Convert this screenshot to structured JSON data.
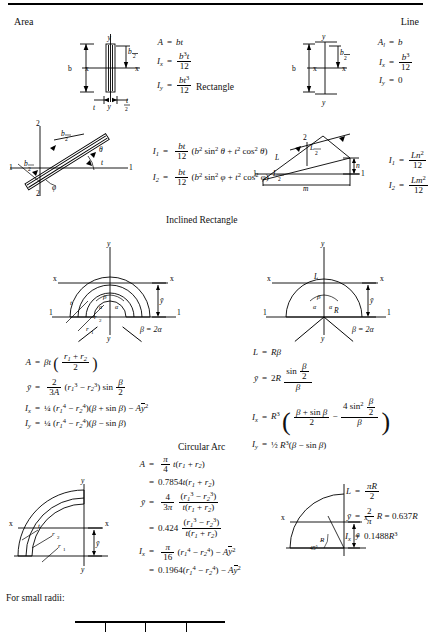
{
  "page": {
    "column_headers": {
      "left": "Area",
      "right": "Line"
    },
    "footer_note": "For small radii:"
  },
  "sections": [
    {
      "id": "rectangle",
      "caption": "Rectangle",
      "area": {
        "diagram_labels": [
          "y",
          "x",
          "x",
          "y",
          "b",
          "t",
          "b/2",
          "t/2"
        ],
        "equations": [
          {
            "lhs": "A",
            "rhs": "bt"
          },
          {
            "lhs": "Ix",
            "rhs": "b³t / 12"
          },
          {
            "lhs": "Iy",
            "rhs": "bt³ / 12"
          }
        ]
      },
      "line": {
        "diagram_labels": [
          "y",
          "x",
          "x",
          "y",
          "b",
          "b/2"
        ],
        "equations": [
          {
            "lhs": "Al",
            "rhs": "b"
          },
          {
            "lhs": "Ix",
            "rhs": "b³ / 12"
          },
          {
            "lhs": "Iy",
            "rhs": "0"
          }
        ]
      }
    },
    {
      "id": "inclined-rectangle",
      "caption": "Inclined Rectangle",
      "area": {
        "diagram_labels": [
          "1",
          "1",
          "2",
          "2",
          "b/2",
          "b/2",
          "t",
          "θ",
          "φ"
        ],
        "equations": [
          {
            "lhs": "I1",
            "rhs": "bt/12 (b² sin² θ + t² cos² θ)"
          },
          {
            "lhs": "I2",
            "rhs": "bt/12 (b² sin² φ + t² cos² φ)"
          }
        ]
      },
      "line": {
        "diagram_labels": [
          "1",
          "1",
          "2",
          "L",
          "L/2",
          "L/2",
          "n",
          "m"
        ],
        "equations": [
          {
            "lhs": "I1",
            "rhs": "Ln² / 12"
          },
          {
            "lhs": "I2",
            "rhs": "Lm² / 12"
          }
        ]
      }
    },
    {
      "id": "circular-arc",
      "caption": "Circular Arc",
      "area": {
        "diagram_labels": [
          "y",
          "x",
          "x",
          "1",
          "1",
          "y",
          "α",
          "α",
          "β",
          "t",
          "r1",
          "r2",
          "ȳ"
        ],
        "beta_note": "β = 2α",
        "equations": [
          {
            "lhs": "A",
            "rhs": "βt ( (r₁ + r₂) / 2 )"
          },
          {
            "lhs": "ȳ",
            "rhs": "2/(3A) (r₁³ − r₂³) sin β/2"
          },
          {
            "lhs": "Ix",
            "rhs": "¼ (r₁⁴ − r₂⁴)(β + sin β) − Aȳ²"
          },
          {
            "lhs": "Iy",
            "rhs": "¼ (r₁⁴ − r₂⁴)(β − sin β)"
          }
        ]
      },
      "line": {
        "diagram_labels": [
          "y",
          "x",
          "x",
          "1",
          "1",
          "y",
          "L",
          "R",
          "β",
          "ȳ"
        ],
        "beta_note": "β = 2α",
        "equations": [
          {
            "lhs": "L",
            "rhs": "Rβ"
          },
          {
            "lhs": "ȳ",
            "rhs": "2R sin(β/2) / β"
          },
          {
            "lhs": "Ix",
            "rhs": "R³ ( (β + sin β)/2 − 4 sin²(β/2)/β )"
          },
          {
            "lhs": "Iy",
            "rhs": "½ R³(β − sin β)"
          }
        ]
      }
    },
    {
      "id": "quarter-circular-arc",
      "caption": "",
      "area": {
        "diagram_labels": [
          "y",
          "x",
          "x",
          "y",
          "t",
          "r1",
          "r2",
          "ȳ"
        ],
        "equations": [
          {
            "lhs": "A",
            "rhs": "π/4 t(r₁ + r₂)"
          },
          {
            "lhs": "",
            "rhs": "0.7854t(r₁ + r₂)"
          },
          {
            "lhs": "ȳ",
            "rhs": "4/(3π) · (r₁³ − r₂³)/(t(r₁ + r₂))"
          },
          {
            "lhs": "",
            "rhs": "0.424 (r₁³ − r₂³)/(t(r₁ + r₂))"
          },
          {
            "lhs": "Ix",
            "rhs": "π/16 (r₁⁴ − r₂⁴) − Aȳ²"
          },
          {
            "lhs": "",
            "rhs": "0.1964(r₁⁴ − r₂⁴) − Aȳ²"
          }
        ]
      },
      "line": {
        "diagram_labels": [
          "x",
          "x",
          "R",
          "45°",
          "ȳ"
        ],
        "equations": [
          {
            "lhs": "L",
            "rhs": "πR / 2"
          },
          {
            "lhs": "ȳ",
            "rhs": "2/π R = 0.637R"
          },
          {
            "lhs": "Ix",
            "rhs": "0.1488R³"
          }
        ]
      }
    }
  ],
  "glyphs": {
    "A": "A",
    "Ix": "I",
    "Iy": "I",
    "I1": "I",
    "I2": "I",
    "Al": "A",
    "L": "L",
    "ybar": "ȳ",
    "beta": "β",
    "alpha": "α",
    "theta": "θ",
    "phi": "φ",
    "pi": "π",
    "R": "R",
    "equals": "=",
    "plus": "+",
    "minus": "−"
  }
}
